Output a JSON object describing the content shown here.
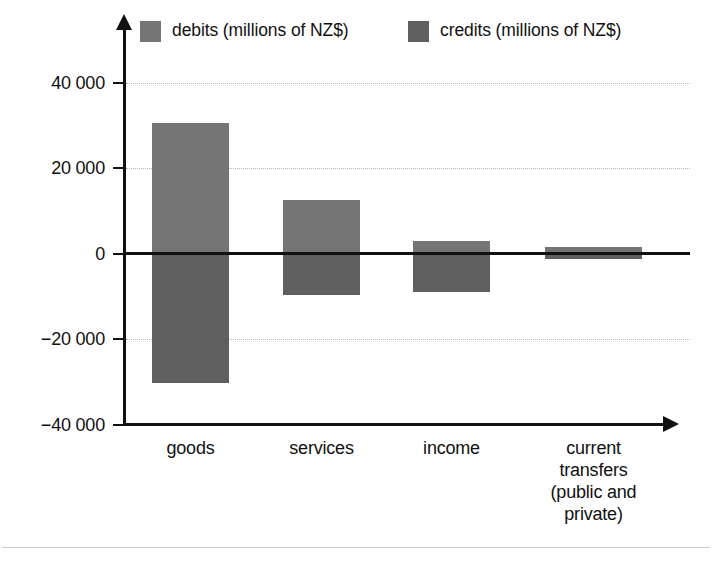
{
  "chart_data": {
    "type": "bar",
    "title": "",
    "subtitle": "",
    "xlabel": "",
    "ylabel": "",
    "categories": [
      "goods",
      "services",
      "income",
      "current transfers (public and private)"
    ],
    "category_label_lines": [
      [
        "goods"
      ],
      [
        "services"
      ],
      [
        "income"
      ],
      [
        "current",
        "transfers",
        "(public and",
        "private)"
      ]
    ],
    "series": [
      {
        "name": "debits (millions of NZ$)",
        "color": "#757575",
        "values": [
          30600,
          12400,
          3000,
          1600
        ]
      },
      {
        "name": "credits (millions of NZ$)",
        "color": "#5f5f5f",
        "values": [
          -30400,
          -9800,
          -9100,
          -1400
        ]
      }
    ],
    "ylim": [
      -40000,
      40000
    ],
    "yticks": [
      40000,
      20000,
      0,
      -20000,
      -40000
    ],
    "ytick_labels": [
      "40 000",
      "20 000",
      "0",
      "−20 000",
      "−40 000"
    ],
    "gridlines": [
      40000,
      20000,
      -20000
    ],
    "zero_line": 0,
    "grid": true,
    "legend_position": "top",
    "axis_arrows": true,
    "orientation": "vertical",
    "bar_mode": "diverging"
  },
  "legend": {
    "entries": [
      {
        "label": "debits (millions of NZ$)",
        "color": "#757575"
      },
      {
        "label": "credits (millions of NZ$)",
        "color": "#5f5f5f"
      }
    ]
  },
  "axes": {
    "y": {
      "tick_labels": [
        "40 000",
        "20 000",
        "0",
        "−20 000",
        "−40 000"
      ]
    },
    "x": {
      "tick_labels": [
        "goods",
        "services",
        "income",
        "current transfers (public and private)"
      ]
    }
  }
}
